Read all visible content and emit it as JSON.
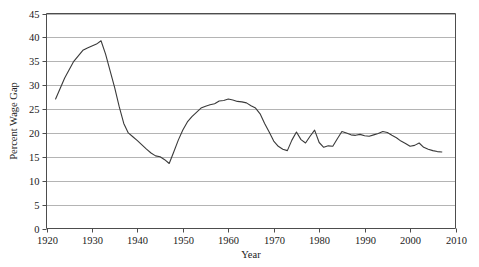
{
  "chart_data": {
    "type": "line",
    "title": "",
    "xlabel": "Year",
    "ylabel": "Percent Wage Gap",
    "xlim": [
      1920,
      2010
    ],
    "ylim": [
      0,
      45
    ],
    "xticks": [
      1920,
      1930,
      1940,
      1950,
      1960,
      1970,
      1980,
      1990,
      2000,
      2010
    ],
    "yticks": [
      0,
      5,
      10,
      15,
      20,
      25,
      30,
      35,
      40,
      45
    ],
    "grid": "horizontal",
    "legend": "none",
    "line_color": "#3a3a3a",
    "grid_color": "#b4b4b4",
    "axis_color": "#4d4d4d",
    "series": [
      {
        "name": "Percent Wage Gap",
        "x": [
          1922,
          1924,
          1926,
          1928,
          1929,
          1930,
          1931,
          1932,
          1933,
          1934,
          1935,
          1936,
          1937,
          1938,
          1939,
          1940,
          1941,
          1942,
          1943,
          1944,
          1945,
          1946,
          1947,
          1948,
          1949,
          1950,
          1951,
          1952,
          1953,
          1954,
          1955,
          1956,
          1957,
          1958,
          1959,
          1960,
          1961,
          1962,
          1963,
          1964,
          1965,
          1966,
          1967,
          1968,
          1969,
          1970,
          1971,
          1972,
          1973,
          1974,
          1975,
          1976,
          1977,
          1978,
          1979,
          1980,
          1981,
          1982,
          1983,
          1984,
          1985,
          1986,
          1987,
          1988,
          1989,
          1990,
          1991,
          1992,
          1993,
          1994,
          1995,
          1996,
          1997,
          1998,
          1999,
          2000,
          2001,
          2002,
          2003,
          2004,
          2005,
          2006,
          2007
        ],
        "y": [
          27.1,
          31.5,
          35.0,
          37.3,
          37.8,
          38.2,
          38.6,
          39.3,
          36.5,
          33.0,
          29.5,
          25.5,
          22.0,
          20.0,
          19.2,
          18.4,
          17.5,
          16.6,
          15.8,
          15.2,
          15.0,
          14.4,
          13.6,
          16.0,
          18.5,
          20.6,
          22.3,
          23.4,
          24.3,
          25.2,
          25.6,
          25.9,
          26.1,
          26.7,
          26.8,
          27.1,
          26.9,
          26.6,
          26.5,
          26.3,
          25.7,
          25.2,
          24.0,
          22.0,
          20.2,
          18.3,
          17.2,
          16.6,
          16.3,
          18.5,
          20.2,
          18.6,
          17.9,
          19.3,
          20.6,
          18.0,
          17.0,
          17.3,
          17.2,
          18.8,
          20.3,
          20.0,
          19.6,
          19.5,
          19.7,
          19.4,
          19.3,
          19.6,
          19.9,
          20.3,
          20.1,
          19.5,
          19.0,
          18.3,
          17.8,
          17.2,
          17.4,
          17.9,
          17.0,
          16.6,
          16.3,
          16.1,
          16.0
        ]
      }
    ]
  }
}
